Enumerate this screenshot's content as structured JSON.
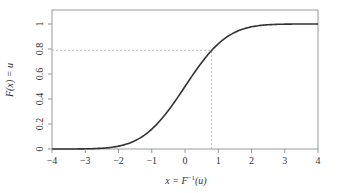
{
  "chart_data": {
    "type": "line",
    "title": "",
    "xlabel": "x = F⁻¹(u)",
    "ylabel": "F(x) = u",
    "xlim": [
      -4,
      4
    ],
    "ylim": [
      0,
      1.1
    ],
    "x_ticks": [
      "-4",
      "-3",
      "-2",
      "-1",
      "0",
      "1",
      "2",
      "3",
      "4"
    ],
    "y_ticks": [
      "0",
      "0.2",
      "0.4",
      "0.6",
      "0.8",
      "1"
    ],
    "grid": false,
    "legend": null,
    "series": [
      {
        "name": "Normal CDF",
        "description": "Standard normal cumulative distribution function",
        "x": [
          -4,
          -3,
          -2.5,
          -2,
          -1.5,
          -1,
          -0.5,
          0,
          0.5,
          0.8,
          1,
          1.5,
          2,
          2.5,
          3,
          4
        ],
        "values": [
          0.0,
          0.001,
          0.006,
          0.023,
          0.067,
          0.159,
          0.309,
          0.5,
          0.691,
          0.788,
          0.841,
          0.933,
          0.977,
          0.994,
          0.999,
          1.0
        ],
        "color": "#333333"
      }
    ],
    "annotations": [
      {
        "type": "dashed-hline",
        "y": 0.79,
        "x_from": -4,
        "x_to": 0.8
      },
      {
        "type": "dashed-vline",
        "x": 0.8,
        "y_from": 0,
        "y_to": 0.79
      }
    ]
  },
  "axes": {
    "xlabel_main": "x = F",
    "xlabel_sup": "−1",
    "xlabel_tail": "(u)",
    "ylabel": "F(x) = u"
  }
}
